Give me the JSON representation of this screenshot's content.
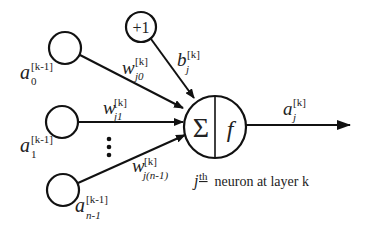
{
  "diagram": {
    "bias_node": {
      "label": "+1",
      "weight_label": "b",
      "weight_sub": "j",
      "weight_sup": "[k]"
    },
    "inputs": [
      {
        "name": "a",
        "sub": "0",
        "sup": "[k-1]",
        "weight": "w",
        "weight_sub": "j0",
        "weight_sup": "[k]"
      },
      {
        "name": "a",
        "sub": "1",
        "sup": "[k-1]",
        "weight": "w",
        "weight_sub": "j1",
        "weight_sup": "[k]"
      },
      {
        "name": "a",
        "sub": "n-1",
        "sup": "[k-1]",
        "weight": "w",
        "weight_sub": "j(n-1)",
        "weight_sup": "[k]"
      }
    ],
    "ellipsis": "⋮",
    "neuron": {
      "sum_symbol": "Σ",
      "activation_symbol": "f"
    },
    "output": {
      "name": "a",
      "sub": "j",
      "sup": "[k]"
    },
    "caption": {
      "index": "j",
      "ordinal": "th",
      "text": " neuron at layer k"
    }
  }
}
